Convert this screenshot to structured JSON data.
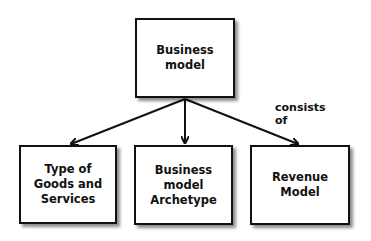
{
  "diagram": {
    "type": "hierarchy",
    "root": {
      "label": "Business\nmodel"
    },
    "children": [
      {
        "label": "Type of\nGoods and\nServices"
      },
      {
        "label": "Business\nmodel\nArchetype"
      },
      {
        "label": "Revenue\nModel"
      }
    ],
    "relation_label": "consists\nof",
    "edges": [
      {
        "from": "Business model",
        "to": "Type of Goods and Services"
      },
      {
        "from": "Business model",
        "to": "Business model Archetype"
      },
      {
        "from": "Business model",
        "to": "Revenue Model"
      }
    ],
    "colors": {
      "stroke": "#111111",
      "background": "#ffffff",
      "box_fill": "#ffffff"
    }
  }
}
